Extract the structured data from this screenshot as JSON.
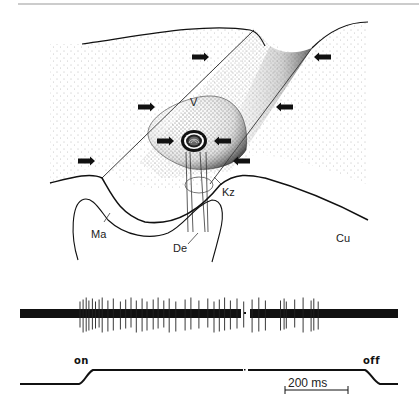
{
  "figure": {
    "type": "scientific-illustration",
    "labels": {
      "V": "V",
      "Kz": "Kz",
      "Ma": "Ma",
      "De": "De",
      "Cu": "Cu"
    },
    "arrows": {
      "count": 8,
      "description": "Horizontal arrows indicating pressure direction converging on the central groove"
    }
  },
  "recording": {
    "spike_trace": {
      "description": "Extracellular spike recording",
      "burst1_spike_times_ms": [
        0,
        7,
        14,
        20,
        28,
        35,
        43,
        50,
        63,
        75,
        91,
        103,
        115,
        127,
        140,
        151,
        165,
        176,
        189,
        201,
        216,
        237,
        250,
        268,
        288,
        302,
        314,
        326,
        339,
        354,
        369,
        388,
        403,
        418
      ],
      "burst2_spike_times_ms": [
        452,
        460,
        465,
        484,
        503,
        521,
        527,
        537
      ],
      "break_marker_ms": 426
    },
    "stimulus_trace": {
      "on_label": "on",
      "off_label": "off",
      "on_time_ms": 0,
      "off_time_ms": 665
    },
    "scale_bar": {
      "label": "200 ms",
      "value_ms": 200
    }
  }
}
